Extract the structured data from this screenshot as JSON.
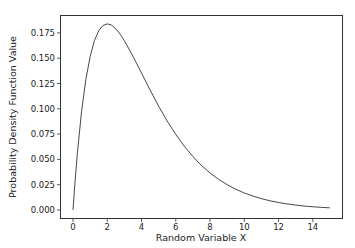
{
  "chart_data": {
    "type": "line",
    "title": "",
    "xlabel": "Random Variable X",
    "ylabel": "Probability Density Function Value",
    "xlim": [
      -0.75,
      15.75
    ],
    "ylim": [
      -0.0092,
      0.1931
    ],
    "grid": false,
    "legend": null,
    "x_ticks": [
      0,
      2,
      4,
      6,
      8,
      10,
      12,
      14
    ],
    "x_tick_labels": [
      "0",
      "2",
      "4",
      "6",
      "8",
      "10",
      "12",
      "14"
    ],
    "y_ticks": [
      0.0,
      0.025,
      0.05,
      0.075,
      0.1,
      0.125,
      0.15,
      0.175
    ],
    "y_tick_labels": [
      "0.000",
      "0.025",
      "0.050",
      "0.075",
      "0.100",
      "0.125",
      "0.150",
      "0.175"
    ],
    "series": [
      {
        "name": "pdf",
        "color": "#333333",
        "x": [
          0,
          0.1,
          0.25,
          0.5,
          0.75,
          1,
          1.25,
          1.5,
          1.75,
          2,
          2.25,
          2.5,
          2.75,
          3,
          3.5,
          4,
          4.5,
          5,
          5.5,
          6,
          6.5,
          7,
          7.5,
          8,
          8.5,
          9,
          9.5,
          10,
          10.5,
          11,
          11.5,
          12,
          12.5,
          13,
          13.5,
          14,
          14.5,
          15
        ],
        "y": [
          0.0,
          0.0238,
          0.0551,
          0.0974,
          0.1289,
          0.1516,
          0.1673,
          0.1771,
          0.1823,
          0.1839,
          0.1827,
          0.1791,
          0.1738,
          0.1673,
          0.152,
          0.1353,
          0.1186,
          0.1026,
          0.0879,
          0.0747,
          0.063,
          0.0528,
          0.044,
          0.0366,
          0.0303,
          0.025,
          0.0206,
          0.0168,
          0.0138,
          0.0112,
          0.0091,
          0.0074,
          0.006,
          0.0049,
          0.0039,
          0.0032,
          0.0026,
          0.0021
        ]
      }
    ]
  }
}
